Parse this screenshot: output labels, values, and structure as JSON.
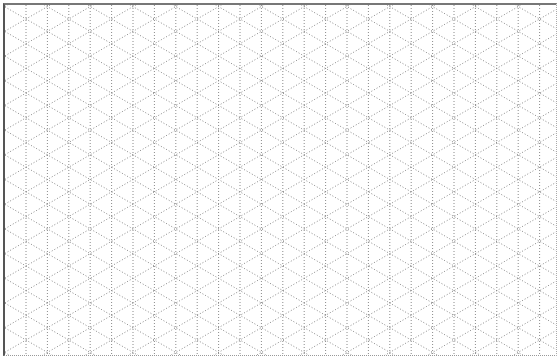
{
  "sheet": {
    "pattern": "isometric-dotted-grid",
    "line_color": "#8a8a8a",
    "border_color": "#555555",
    "background": "#ffffff",
    "vertical_spacing_px": 21.4,
    "line_style": "dotted"
  }
}
